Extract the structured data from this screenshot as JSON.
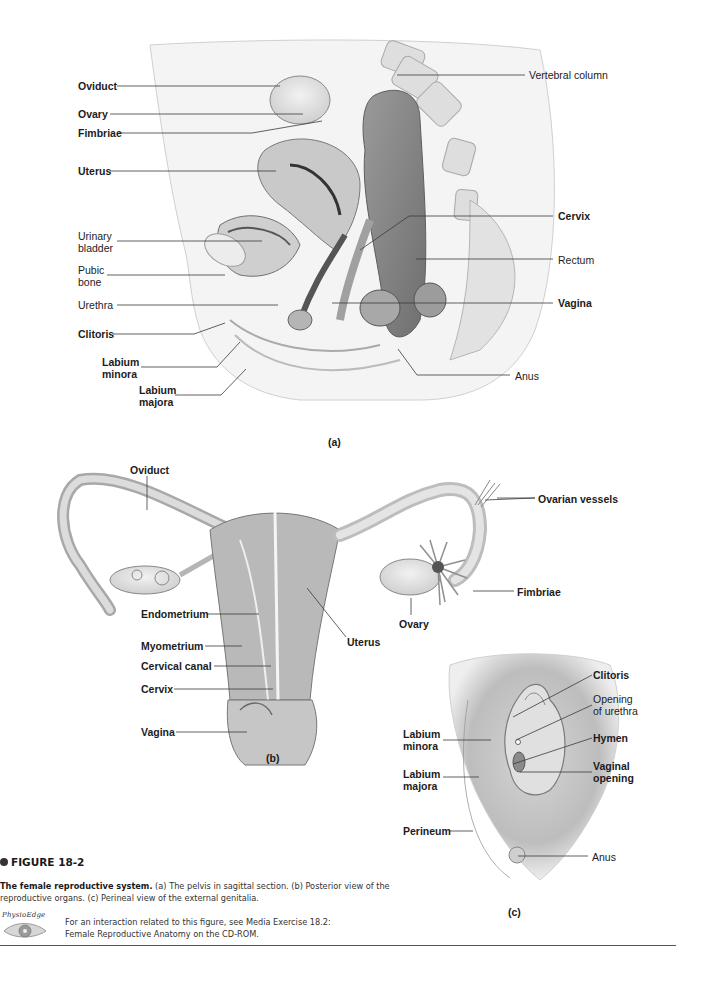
{
  "figure": {
    "number_label": "FIGURE 18-2",
    "title_lead": "The female reproductive system.",
    "title_rest": " (a) The pelvis in sagittal section. (b) Posterior view of the reproductive organs. (c) Perineal view of the external genitalia.",
    "media_logo": "PhysioEdge",
    "media_line1": "For an interaction related to this figure, see Media Exercise 18.2:",
    "media_line2": "Female Reproductive Anatomy on the CD-ROM."
  },
  "panel_a": {
    "panel_label": "(a)",
    "labels": {
      "oviduct": "Oviduct",
      "ovary": "Ovary",
      "fimbriae": "Fimbriae",
      "uterus": "Uterus",
      "urinary_bladder_1": "Urinary",
      "urinary_bladder_2": "bladder",
      "pubic_bone_1": "Pubic",
      "pubic_bone_2": "bone",
      "urethra": "Urethra",
      "clitoris": "Clitoris",
      "labium_minora_1": "Labium",
      "labium_minora_2": "minora",
      "labium_majora_1": "Labium",
      "labium_majora_2": "majora",
      "vertebral_column": "Vertebral column",
      "cervix": "Cervix",
      "rectum": "Rectum",
      "vagina": "Vagina",
      "anus": "Anus"
    }
  },
  "panel_b": {
    "panel_label": "(b)",
    "labels": {
      "oviduct": "Oviduct",
      "ovarian_vessels": "Ovarian vessels",
      "fimbriae": "Fimbriae",
      "ovary": "Ovary",
      "uterus": "Uterus",
      "endometrium": "Endometrium",
      "myometrium": "Myometrium",
      "cervical_canal": "Cervical canal",
      "cervix": "Cervix",
      "vagina": "Vagina"
    }
  },
  "panel_c": {
    "panel_label": "(c)",
    "labels": {
      "clitoris": "Clitoris",
      "opening_urethra_1": "Opening",
      "opening_urethra_2": "of urethra",
      "hymen": "Hymen",
      "vaginal_opening_1": "Vaginal",
      "vaginal_opening_2": "opening",
      "labium_minora_1": "Labium",
      "labium_minora_2": "minora",
      "labium_majora_1": "Labium",
      "labium_majora_2": "majora",
      "perineum": "Perineum",
      "anus": "Anus"
    }
  },
  "colors": {
    "tissue_light": "#e9e9e9",
    "tissue_mid": "#c8c8c8",
    "tissue_dark": "#8f8f8f",
    "leader_line": "#3a3a3a"
  }
}
